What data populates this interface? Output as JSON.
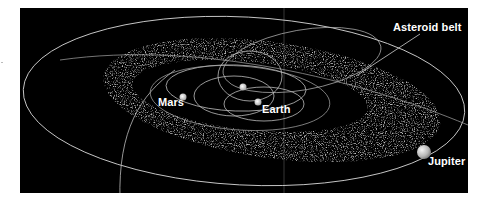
{
  "diagram": {
    "background_color": "#000000",
    "orbit_color": "#cfcfcf",
    "belt_color": "#bdbdbd",
    "labels": {
      "asteroid_belt": "Asteroid belt",
      "mars": "Mars",
      "earth": "Earth",
      "jupiter": "Jupiter"
    },
    "bodies": [
      {
        "name": "Sun",
        "x": 243,
        "y": 87,
        "r": 3.5
      },
      {
        "name": "Earth",
        "x": 258,
        "y": 102,
        "r": 3.5
      },
      {
        "name": "Mars",
        "x": 183,
        "y": 97,
        "r": 3.5
      },
      {
        "name": "Jupiter",
        "x": 424,
        "y": 152,
        "r": 7
      }
    ]
  }
}
